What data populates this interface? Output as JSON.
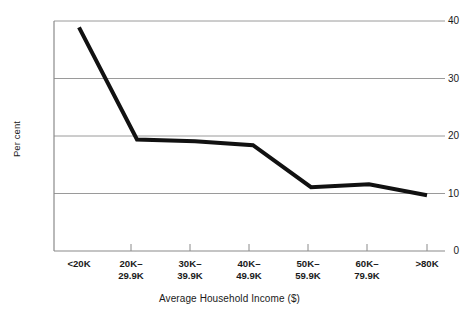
{
  "chart_data": {
    "type": "line",
    "title": "",
    "subtitle": "",
    "xlabel": "Average Household Income ($)",
    "ylabel": "Per cent",
    "categories": [
      "<20K",
      "20K–\n29.9K",
      "30K–\n39.9K",
      "40K–\n49.9K",
      "50K–\n59.9K",
      "60K–\n79.9K",
      ">80K"
    ],
    "category_labels_flat": [
      "<20K",
      "20K–29.9K",
      "30K–39.9K",
      "40K–49.9K",
      "50K–59.9K",
      "60K–79.9K",
      ">80K"
    ],
    "values": [
      38.9,
      19.4,
      19.1,
      18.4,
      11.1,
      11.6,
      9.7
    ],
    "series": [
      {
        "name": "Per cent",
        "values": [
          38.9,
          19.4,
          19.1,
          18.4,
          11.1,
          11.6,
          9.7
        ],
        "color": "#111111",
        "line_width": 4
      }
    ],
    "ylim": [
      0,
      40
    ],
    "yticks": [
      0,
      10,
      20,
      30,
      40
    ],
    "ytick_labels": [
      "0",
      "10",
      "20",
      "30",
      "40"
    ],
    "grid": "horizontal",
    "legend": "none",
    "markers": "none"
  },
  "colors": {
    "line": "#111111",
    "gridline": "#9a9a9a",
    "axis": "#8a8a8a",
    "background": "#ffffff",
    "text": "#1a1a1a"
  }
}
